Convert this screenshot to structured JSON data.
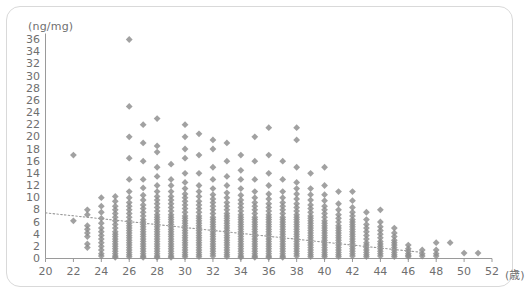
{
  "chart_data": {
    "type": "scatter",
    "title": "",
    "xlabel": "(歳)",
    "ylabel": "(ng/mg)",
    "xlim": [
      20,
      52
    ],
    "ylim": [
      0,
      36
    ],
    "xticks": [
      20,
      22,
      24,
      26,
      28,
      30,
      32,
      34,
      36,
      38,
      40,
      42,
      44,
      46,
      48,
      50,
      52
    ],
    "yticks": [
      0,
      2,
      4,
      6,
      8,
      10,
      12,
      14,
      16,
      18,
      20,
      22,
      24,
      26,
      28,
      30,
      32,
      34,
      36
    ],
    "grid": false,
    "legend": null,
    "marker": {
      "shape": "diamond",
      "color": "#8c8c8c",
      "size": 3.4
    },
    "axis_color": "#9a9a9a",
    "tick_label_color": "#6f6f6f",
    "trendline": {
      "style": "dotted",
      "color": "#9a9a9a",
      "x_start": 20.0,
      "y_start": 7.5,
      "x_end": 47.0,
      "y_end": 1.0
    },
    "columns": [
      {
        "age": 22,
        "values": [
          17.0,
          6.2
        ]
      },
      {
        "age": 23,
        "values": [
          8.0,
          7.2,
          5.4,
          4.8,
          4.2,
          3.6,
          2.4,
          1.8
        ]
      },
      {
        "age": 24,
        "values": [
          10.0,
          8.6,
          7.6,
          6.6,
          5.8,
          5.0,
          4.4,
          3.8,
          3.2,
          2.6,
          2.0,
          1.4,
          0.8,
          0.4
        ]
      },
      {
        "age": 25,
        "values": [
          10.2,
          9.4,
          8.6,
          8.0,
          7.4,
          6.8,
          6.2,
          5.6,
          5.0,
          4.4,
          4.0,
          3.6,
          3.2,
          2.8,
          2.4,
          2.0,
          1.6,
          1.2,
          0.8,
          0.4,
          0.2
        ]
      },
      {
        "age": 26,
        "values": [
          36.0,
          25.0,
          20.0,
          16.5,
          13.0,
          11.0,
          10.0,
          9.2,
          8.6,
          8.0,
          7.4,
          6.8,
          6.2,
          5.8,
          5.4,
          5.0,
          4.6,
          4.2,
          3.8,
          3.4,
          3.0,
          2.6,
          2.2,
          1.8,
          1.4,
          1.0,
          0.6,
          0.3
        ]
      },
      {
        "age": 27,
        "values": [
          22.0,
          19.0,
          16.0,
          13.0,
          11.6,
          10.4,
          9.6,
          8.8,
          8.2,
          7.6,
          7.0,
          6.4,
          6.0,
          5.6,
          5.2,
          4.8,
          4.4,
          4.0,
          3.6,
          3.2,
          2.8,
          2.4,
          2.0,
          1.6,
          1.2,
          0.8,
          0.4,
          0.2
        ]
      },
      {
        "age": 28,
        "values": [
          23.0,
          18.5,
          17.5,
          15.0,
          13.5,
          12.0,
          11.0,
          10.2,
          9.6,
          9.0,
          8.4,
          7.8,
          7.2,
          6.8,
          6.4,
          6.0,
          5.6,
          5.2,
          4.8,
          4.4,
          4.0,
          3.6,
          3.2,
          2.8,
          2.4,
          2.0,
          1.6,
          1.2,
          0.8,
          0.4,
          0.2
        ]
      },
      {
        "age": 29,
        "values": [
          15.5,
          13.0,
          12.0,
          11.0,
          10.2,
          9.6,
          9.0,
          8.4,
          7.8,
          7.2,
          6.8,
          6.4,
          6.0,
          5.6,
          5.2,
          4.8,
          4.4,
          4.0,
          3.6,
          3.2,
          2.8,
          2.4,
          2.0,
          1.6,
          1.2,
          0.8,
          0.4,
          0.2
        ]
      },
      {
        "age": 30,
        "values": [
          22.0,
          20.0,
          18.0,
          16.5,
          14.0,
          12.5,
          11.5,
          10.6,
          10.0,
          9.4,
          8.8,
          8.2,
          7.6,
          7.0,
          6.6,
          6.2,
          5.8,
          5.4,
          5.0,
          4.6,
          4.2,
          3.8,
          3.4,
          3.0,
          2.6,
          2.2,
          1.8,
          1.4,
          1.0,
          0.6,
          0.3
        ]
      },
      {
        "age": 31,
        "values": [
          20.5,
          17.0,
          14.0,
          12.0,
          11.0,
          10.2,
          9.4,
          8.8,
          8.2,
          7.6,
          7.0,
          6.6,
          6.2,
          5.8,
          5.4,
          5.0,
          4.6,
          4.2,
          3.8,
          3.4,
          3.0,
          2.6,
          2.2,
          1.8,
          1.4,
          1.0,
          0.6,
          0.3
        ]
      },
      {
        "age": 32,
        "values": [
          19.5,
          18.0,
          15.0,
          13.0,
          11.5,
          10.5,
          9.8,
          9.2,
          8.6,
          8.0,
          7.4,
          6.8,
          6.4,
          6.0,
          5.6,
          5.2,
          4.8,
          4.4,
          4.0,
          3.6,
          3.2,
          2.8,
          2.4,
          2.0,
          1.6,
          1.2,
          0.8,
          0.4
        ]
      },
      {
        "age": 33,
        "values": [
          19.0,
          16.0,
          13.5,
          12.0,
          10.8,
          10.0,
          9.2,
          8.6,
          8.0,
          7.4,
          7.0,
          6.6,
          6.2,
          5.8,
          5.4,
          5.0,
          4.6,
          4.2,
          3.8,
          3.4,
          3.0,
          2.6,
          2.2,
          1.8,
          1.4,
          1.0,
          0.6,
          0.3
        ]
      },
      {
        "age": 34,
        "values": [
          17.0,
          14.5,
          13.0,
          11.5,
          10.4,
          9.6,
          9.0,
          8.4,
          7.8,
          7.2,
          6.8,
          6.4,
          6.0,
          5.6,
          5.2,
          4.8,
          4.4,
          4.0,
          3.6,
          3.2,
          2.8,
          2.4,
          2.0,
          1.6,
          1.2,
          0.8,
          0.4,
          0.2
        ]
      },
      {
        "age": 35,
        "values": [
          20.0,
          16.0,
          13.0,
          11.0,
          10.0,
          9.2,
          8.6,
          8.0,
          7.4,
          6.8,
          6.4,
          6.0,
          5.6,
          5.2,
          4.8,
          4.4,
          4.0,
          3.6,
          3.2,
          2.8,
          2.4,
          2.0,
          1.6,
          1.2,
          0.8,
          0.4,
          0.2
        ]
      },
      {
        "age": 36,
        "values": [
          21.5,
          17.0,
          14.0,
          12.0,
          10.6,
          9.8,
          9.0,
          8.4,
          7.8,
          7.2,
          6.8,
          6.4,
          6.0,
          5.6,
          5.2,
          4.8,
          4.4,
          4.0,
          3.6,
          3.2,
          2.8,
          2.4,
          2.0,
          1.6,
          1.2,
          0.8,
          0.4,
          0.2
        ]
      },
      {
        "age": 37,
        "values": [
          16.0,
          13.0,
          11.0,
          10.0,
          9.2,
          8.6,
          8.0,
          7.4,
          6.8,
          6.4,
          6.0,
          5.6,
          5.2,
          4.8,
          4.4,
          4.0,
          3.6,
          3.2,
          2.8,
          2.4,
          2.0,
          1.6,
          1.2,
          0.8,
          0.4,
          0.2
        ]
      },
      {
        "age": 38,
        "values": [
          21.5,
          19.5,
          15.0,
          12.5,
          11.5,
          10.6,
          9.8,
          9.0,
          8.4,
          7.8,
          7.2,
          6.8,
          6.4,
          6.0,
          5.6,
          5.2,
          4.8,
          4.4,
          4.0,
          3.6,
          3.2,
          2.8,
          2.4,
          2.0,
          1.6,
          1.2,
          0.8,
          0.4
        ]
      },
      {
        "age": 39,
        "values": [
          14.0,
          11.5,
          10.5,
          9.6,
          8.8,
          8.2,
          7.6,
          7.0,
          6.6,
          6.2,
          5.8,
          5.4,
          5.0,
          4.6,
          4.2,
          3.8,
          3.4,
          3.0,
          2.6,
          2.2,
          1.8,
          1.4,
          1.0,
          0.6,
          0.3
        ]
      },
      {
        "age": 40,
        "values": [
          15.0,
          12.0,
          10.5,
          9.5,
          8.6,
          8.0,
          7.4,
          6.8,
          6.2,
          5.8,
          5.4,
          5.0,
          4.6,
          4.2,
          3.8,
          3.4,
          3.0,
          2.6,
          2.2,
          1.8,
          1.4,
          1.0,
          0.6,
          0.3
        ]
      },
      {
        "age": 41,
        "values": [
          11.0,
          9.0,
          8.0,
          7.2,
          6.6,
          6.0,
          5.4,
          5.0,
          4.6,
          4.2,
          3.8,
          3.4,
          3.0,
          2.6,
          2.2,
          1.8,
          1.4,
          1.0,
          0.6,
          0.3
        ]
      },
      {
        "age": 42,
        "values": [
          11.0,
          9.5,
          8.4,
          7.6,
          7.0,
          6.4,
          6.0,
          5.6,
          5.2,
          4.8,
          4.4,
          4.0,
          3.6,
          3.2,
          2.8,
          2.4,
          2.0,
          1.6,
          1.2,
          0.8,
          0.4
        ]
      },
      {
        "age": 43,
        "values": [
          7.6,
          6.4,
          5.6,
          5.0,
          4.4,
          3.8,
          3.2,
          2.6,
          2.2,
          1.8,
          1.4,
          1.0,
          0.6,
          0.3
        ]
      },
      {
        "age": 44,
        "values": [
          8.0,
          6.0,
          5.2,
          4.6,
          4.0,
          3.4,
          2.8,
          2.4,
          2.0,
          1.6,
          1.2,
          0.8,
          0.4
        ]
      },
      {
        "age": 45,
        "values": [
          5.0,
          4.2,
          3.6,
          3.0,
          2.6,
          2.2,
          1.8,
          1.4,
          1.0,
          0.6,
          0.3
        ]
      },
      {
        "age": 46,
        "values": [
          2.2,
          1.6,
          1.2,
          0.8,
          0.5,
          0.3
        ]
      },
      {
        "age": 47,
        "values": [
          1.4,
          0.8,
          0.4
        ]
      },
      {
        "age": 48,
        "values": [
          2.6,
          1.4,
          0.8,
          0.4
        ]
      },
      {
        "age": 49,
        "values": [
          2.6
        ]
      },
      {
        "age": 50,
        "values": [
          0.9
        ]
      },
      {
        "age": 51,
        "values": [
          0.9
        ]
      }
    ]
  }
}
